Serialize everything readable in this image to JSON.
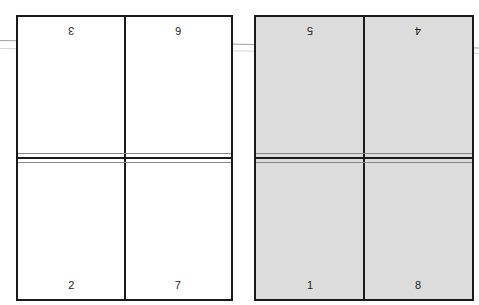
{
  "diagram": {
    "type": "imposition-layout",
    "colors": {
      "left_sheet": "#ffffff",
      "right_sheet": "#dcdcdc",
      "border": "#1a1a1a"
    },
    "left_sheet": {
      "top_pages": [
        "3",
        "6"
      ],
      "bottom_pages": [
        "2",
        "7"
      ]
    },
    "right_sheet": {
      "top_pages": [
        "5",
        "4"
      ],
      "bottom_pages": [
        "1",
        "8"
      ]
    }
  }
}
